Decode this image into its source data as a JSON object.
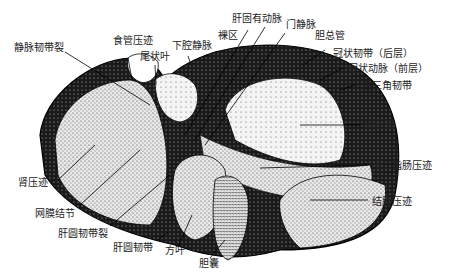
{
  "diagram": {
    "labels": {
      "ligamentum_venosum_fissure": "静脉韧带裂",
      "esophageal_impression": "食管压迹",
      "caudate_lobe": "尾状叶",
      "inferior_vena_cava": "下腔静脉",
      "bare_area": "裸区",
      "proper_hepatic_artery": "肝固有动脉",
      "portal_vein": "门静脉",
      "common_bile_duct": "胆总管",
      "coronary_ligament_posterior": "冠状韧带（后层）",
      "coronary_ligament_anterior": "冠状动脉（前层）",
      "right_triangular_ligament": "右三角韧带",
      "renal_impression_right": "肾压迹",
      "duodenal_impression": "十二指肠压迹",
      "colic_impression": "结肠压迹",
      "renal_impression_left": "肾压迹",
      "omental_tuber": "网膜结节",
      "ligamentum_teres_fissure": "肝圆韧带裂",
      "ligamentum_teres": "肝圆韧带",
      "quadrate_lobe": "方叶",
      "gallbladder": "胆囊"
    }
  }
}
